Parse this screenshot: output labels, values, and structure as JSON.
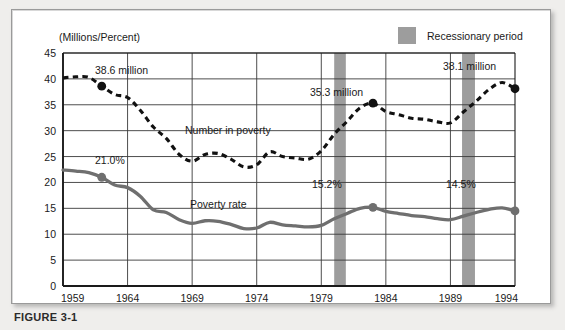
{
  "figure": {
    "caption": "FIGURE 3-1",
    "axis_title": "(Millions/Percent)",
    "legend": {
      "label": "Recessionary period",
      "swatch_color": "#9d9d9d"
    },
    "series_labels": {
      "number_in_poverty": "Number in poverty",
      "poverty_rate": "Poverty rate"
    },
    "annotations": [
      {
        "id": "a1",
        "text": "38.6 million",
        "year": 1962,
        "value": 38.6,
        "series": "number_in_poverty"
      },
      {
        "id": "a2",
        "text": "21.0%",
        "year": 1962,
        "value": 21.0,
        "series": "poverty_rate"
      },
      {
        "id": "a3",
        "text": "35.3 million",
        "year": 1983,
        "value": 35.3,
        "series": "number_in_poverty"
      },
      {
        "id": "a4",
        "text": "15.2%",
        "year": 1983,
        "value": 15.2,
        "series": "poverty_rate"
      },
      {
        "id": "a5",
        "text": "38.1 million",
        "year": 1994,
        "value": 38.1,
        "series": "number_in_poverty"
      },
      {
        "id": "a6",
        "text": "14.5%",
        "year": 1994,
        "value": 14.5,
        "series": "poverty_rate"
      }
    ],
    "colors": {
      "number_in_poverty": "#111111",
      "poverty_rate": "#6f6f6f",
      "recession_band": "#9d9d9d",
      "grid": "#3a3a3a",
      "frame": "#1a1a1a"
    }
  },
  "chart_data": {
    "type": "line",
    "title": "",
    "subtitle": "",
    "xlabel": "",
    "ylabel": "(Millions/Percent)",
    "xlim": [
      1959,
      1994
    ],
    "ylim": [
      0,
      45
    ],
    "ytick_labels": [
      "0",
      "5",
      "10",
      "15",
      "20",
      "25",
      "30",
      "35",
      "40",
      "45"
    ],
    "yticks": [
      0,
      5,
      10,
      15,
      20,
      25,
      30,
      35,
      40,
      45
    ],
    "xtick_labels": [
      "1959",
      "1964",
      "1969",
      "1974",
      "1979",
      "1984",
      "1989",
      "1994"
    ],
    "xticks": [
      1959,
      1964,
      1969,
      1974,
      1979,
      1984,
      1989,
      1994
    ],
    "grid": true,
    "legend_position": "top-right",
    "x": [
      1959,
      1960,
      1961,
      1962,
      1963,
      1964,
      1965,
      1966,
      1967,
      1968,
      1969,
      1970,
      1971,
      1972,
      1973,
      1974,
      1975,
      1976,
      1977,
      1978,
      1979,
      1980,
      1981,
      1982,
      1983,
      1984,
      1985,
      1986,
      1987,
      1988,
      1989,
      1990,
      1991,
      1992,
      1993,
      1994
    ],
    "series": [
      {
        "name": "Number in poverty",
        "units": "millions",
        "style": "dashed",
        "color": "#111111",
        "values": [
          40.2,
          40.4,
          40.3,
          38.6,
          37.0,
          36.4,
          33.9,
          30.7,
          28.5,
          25.4,
          24.1,
          25.4,
          25.6,
          24.5,
          23.0,
          23.4,
          25.9,
          25.0,
          24.7,
          24.5,
          26.1,
          29.3,
          31.8,
          34.4,
          35.3,
          33.7,
          33.1,
          32.4,
          32.2,
          31.7,
          31.5,
          33.6,
          35.7,
          38.0,
          39.3,
          38.1
        ]
      },
      {
        "name": "Poverty rate",
        "units": "percent",
        "style": "solid",
        "color": "#6f6f6f",
        "values": [
          22.4,
          22.2,
          21.9,
          21.0,
          19.5,
          19.0,
          17.3,
          14.7,
          14.2,
          12.8,
          12.1,
          12.6,
          12.5,
          11.9,
          11.1,
          11.2,
          12.3,
          11.8,
          11.6,
          11.4,
          11.7,
          13.0,
          14.0,
          15.0,
          15.2,
          14.4,
          14.0,
          13.6,
          13.4,
          13.0,
          12.8,
          13.5,
          14.2,
          14.8,
          15.1,
          14.5
        ]
      }
    ],
    "recession_bands": [
      {
        "start": 1980.0,
        "end": 1980.9,
        "label": "Recessionary period"
      },
      {
        "start": 1989.9,
        "end": 1990.9,
        "label": "Recessionary period"
      }
    ]
  }
}
